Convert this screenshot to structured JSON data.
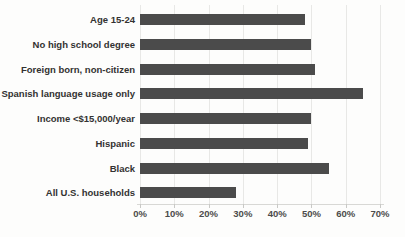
{
  "chart_data": {
    "type": "bar",
    "orientation": "horizontal",
    "title": "",
    "xlabel": "",
    "ylabel": "",
    "categories": [
      "Age 15-24",
      "No high school degree",
      "Foreign born, non-citizen",
      "Spanish language usage only",
      "Income <$15,000/year",
      "Hispanic",
      "Black",
      "All U.S. households"
    ],
    "values": [
      48,
      50,
      51,
      65,
      50,
      49,
      55,
      28
    ],
    "x_tick_labels": [
      "0%",
      "10%",
      "20%",
      "30%",
      "40%",
      "50%",
      "60%",
      "70%"
    ],
    "x_tick_values": [
      0,
      10,
      20,
      30,
      40,
      50,
      60,
      70
    ],
    "xlim": [
      0,
      70
    ],
    "grid": "vertical-gridlines-on",
    "legend": "none",
    "colors": {
      "bar": "#4b4b4b",
      "category_label": "#333231",
      "tick_label": "#4c4c4b",
      "gridline": "#e8e8e6",
      "axis_line": "#d8d8d5",
      "background": "#fdfdfc"
    }
  }
}
